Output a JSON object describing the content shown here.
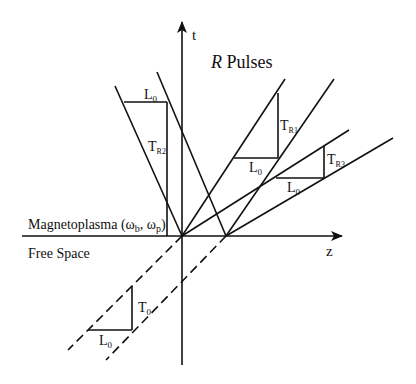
{
  "diagram": {
    "title": "R Pulses",
    "title_italic": "R",
    "title_rest": " Pulses",
    "axes": {
      "t_label": "t",
      "z_label": "z"
    },
    "regions": {
      "upper": "Magnetoplasma (ω",
      "upper_sub1": "b",
      "upper_mid": ", ω",
      "upper_sub2": "p",
      "upper_end": ")",
      "lower": "Free Space"
    },
    "labels": {
      "L0": "L",
      "L0_sub": "0",
      "T0": "T",
      "T0_sub": "0",
      "TR1": "T",
      "TR1_sub": "R1",
      "TR2": "T",
      "TR2_sub": "R2",
      "TR3": "T",
      "TR3_sub": "R3"
    },
    "colors": {
      "line": "#111111",
      "background": "#ffffff"
    }
  }
}
